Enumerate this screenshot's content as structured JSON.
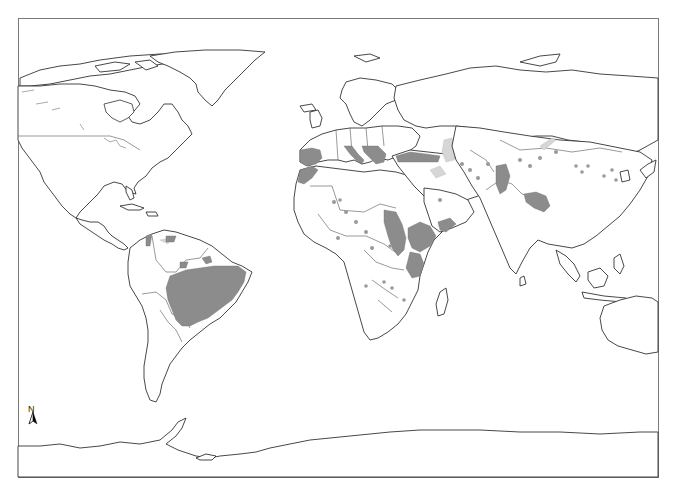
{
  "map": {
    "type": "world distribution map",
    "projection": "equirectangular-like (Robinson/Plate carrée style)",
    "frame": {
      "x": 18,
      "y": 18,
      "width": 640,
      "height": 459
    },
    "north_arrow": {
      "label": "N",
      "x": 33,
      "y": 412
    },
    "legend": null,
    "shading": {
      "high_color": "#8c8c8c",
      "low_color": "#d6d6d6",
      "outline_color": "#333333",
      "background": "#ffffff"
    },
    "highlighted_regions_high": [
      "Central & NE Brazil",
      "Iberian Peninsula (Spain/Portugal)",
      "Morocco / NW Africa coast",
      "Italy & Balkans",
      "Turkey (Anatolia)",
      "Sudan / South Sudan belt",
      "Ethiopia & Eritrea highlands",
      "Kenya / Tanzania (East Africa)",
      "Yemen",
      "Pakistan (Indus valley)",
      "Bangladesh / West Bengal",
      "Central America (Honduras/Nicaragua)"
    ],
    "highlighted_regions_low": [
      "Caspian Sea area",
      "Iran scattered patches",
      "Central Asia scattered patches",
      "Mongolia / China scattered dots",
      "West & Central Africa scattered dots",
      "Venezuela / Guyana patches",
      "Mexico patch"
    ]
  }
}
